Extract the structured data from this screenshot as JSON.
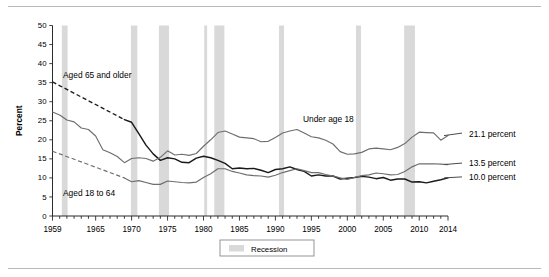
{
  "figure": {
    "frame_top_rule": true,
    "frame_bottom_rule": true
  },
  "legend": {
    "recession_label": "Recession",
    "recession_color": "#d9d9d9"
  },
  "annotations": {
    "aged65_label": "Aged 65 and older",
    "under18_label": "Under age 18",
    "aged18to64_label": "Aged 18 to 64",
    "end_under18": "21.1 percent",
    "end_aged18to64": "13.5 percent",
    "end_aged65": "10.0 percent"
  },
  "chart_data": {
    "type": "line",
    "title": "",
    "subtitle": "",
    "xlabel": "",
    "ylabel": "Percent",
    "xlim": [
      1959,
      2014
    ],
    "ylim": [
      0,
      50
    ],
    "ytick_labels": [
      "0",
      "5",
      "10",
      "15",
      "20",
      "25",
      "30",
      "35",
      "40",
      "45",
      "50"
    ],
    "yticks": [
      0,
      5,
      10,
      15,
      20,
      25,
      30,
      35,
      40,
      45,
      50
    ],
    "xtick_labels": [
      "1959",
      "1965",
      "1970",
      "1975",
      "1980",
      "1985",
      "1990",
      "1995",
      "2000",
      "2005",
      "2010",
      "2014"
    ],
    "xticks_labeled": [
      1959,
      1965,
      1970,
      1975,
      1980,
      1985,
      1990,
      1995,
      2000,
      2005,
      2010,
      2014
    ],
    "xtick_minor_interval": 1,
    "grid": false,
    "legend_position": "below-axis-center",
    "line_colors": {
      "aged_65_and_older": "#1a1a1a",
      "under_age_18": "#6e6e6e",
      "aged_18_to_64": "#6e6e6e"
    },
    "series": [
      {
        "name": "Aged 65 and older",
        "color": "#1a1a1a",
        "dashed_range": [
          1959,
          1969
        ],
        "x": [
          1959,
          1960,
          1961,
          1962,
          1963,
          1964,
          1965,
          1966,
          1967,
          1968,
          1969,
          1970,
          1971,
          1972,
          1973,
          1974,
          1975,
          1976,
          1977,
          1978,
          1979,
          1980,
          1981,
          1982,
          1983,
          1984,
          1985,
          1986,
          1987,
          1988,
          1989,
          1990,
          1991,
          1992,
          1993,
          1994,
          1995,
          1996,
          1997,
          1998,
          1999,
          2000,
          2001,
          2002,
          2003,
          2004,
          2005,
          2006,
          2007,
          2008,
          2009,
          2010,
          2011,
          2012,
          2013,
          2014
        ],
        "y": [
          35.2,
          33.1,
          32.0,
          31.0,
          30.0,
          29.0,
          28.2,
          27.3,
          29.5,
          25.0,
          25.3,
          24.6,
          21.6,
          18.6,
          16.3,
          14.6,
          15.3,
          15.0,
          14.1,
          14.0,
          15.2,
          15.7,
          15.3,
          14.6,
          13.8,
          12.4,
          12.6,
          12.4,
          12.5,
          12.0,
          11.4,
          12.2,
          12.4,
          12.9,
          12.2,
          11.7,
          10.5,
          10.8,
          10.5,
          10.5,
          9.7,
          9.9,
          10.1,
          10.4,
          10.2,
          9.8,
          10.1,
          9.4,
          9.7,
          9.7,
          8.9,
          9.0,
          8.7,
          9.1,
          9.5,
          10.0
        ]
      },
      {
        "name": "Under age 18",
        "color": "#6e6e6e",
        "dashed_range": null,
        "x": [
          1959,
          1960,
          1961,
          1962,
          1963,
          1964,
          1965,
          1966,
          1967,
          1968,
          1969,
          1970,
          1971,
          1972,
          1973,
          1974,
          1975,
          1976,
          1977,
          1978,
          1979,
          1980,
          1981,
          1982,
          1983,
          1984,
          1985,
          1986,
          1987,
          1988,
          1989,
          1990,
          1991,
          1992,
          1993,
          1994,
          1995,
          1996,
          1997,
          1998,
          1999,
          2000,
          2001,
          2002,
          2003,
          2004,
          2005,
          2006,
          2007,
          2008,
          2009,
          2010,
          2011,
          2012,
          2013,
          2014
        ],
        "y": [
          27.3,
          26.5,
          25.2,
          24.7,
          23.1,
          22.7,
          21.0,
          17.4,
          16.6,
          15.6,
          14.0,
          15.1,
          15.3,
          15.1,
          14.4,
          15.4,
          17.1,
          16.0,
          16.2,
          15.9,
          16.4,
          18.3,
          20.0,
          21.9,
          22.3,
          21.5,
          20.7,
          20.5,
          20.3,
          19.5,
          19.6,
          20.6,
          21.8,
          22.3,
          22.7,
          21.8,
          20.8,
          20.5,
          19.9,
          18.9,
          16.9,
          16.2,
          16.3,
          16.7,
          17.6,
          17.8,
          17.6,
          17.4,
          18.0,
          19.0,
          20.7,
          22.0,
          21.9,
          21.8,
          19.9,
          21.1
        ]
      },
      {
        "name": "Aged 18 to 64",
        "color": "#6e6e6e",
        "dashed_range": [
          1959,
          1969
        ],
        "x": [
          1959,
          1960,
          1961,
          1962,
          1963,
          1964,
          1965,
          1966,
          1967,
          1968,
          1969,
          1970,
          1971,
          1972,
          1973,
          1974,
          1975,
          1976,
          1977,
          1978,
          1979,
          1980,
          1981,
          1982,
          1983,
          1984,
          1985,
          1986,
          1987,
          1988,
          1989,
          1990,
          1991,
          1992,
          1993,
          1994,
          1995,
          1996,
          1997,
          1998,
          1999,
          2000,
          2001,
          2002,
          2003,
          2004,
          2005,
          2006,
          2007,
          2008,
          2009,
          2010,
          2011,
          2012,
          2013,
          2014
        ],
        "y": [
          17.0,
          16.2,
          15.5,
          14.9,
          14.2,
          13.6,
          12.9,
          12.3,
          11.5,
          10.8,
          10.0,
          9.0,
          9.3,
          8.8,
          8.3,
          8.3,
          9.2,
          9.0,
          8.8,
          8.7,
          8.9,
          10.1,
          11.1,
          12.4,
          12.4,
          11.7,
          11.3,
          10.8,
          10.6,
          10.5,
          10.2,
          10.7,
          11.4,
          11.9,
          12.4,
          11.9,
          11.4,
          11.4,
          10.9,
          10.5,
          10.0,
          9.6,
          10.1,
          10.6,
          10.8,
          11.3,
          11.1,
          10.8,
          10.9,
          11.7,
          12.9,
          13.7,
          13.7,
          13.7,
          13.6,
          13.5
        ]
      }
    ],
    "recession_bands": [
      {
        "start": 1960.3,
        "end": 1961.1
      },
      {
        "start": 1969.9,
        "end": 1970.8
      },
      {
        "start": 1973.8,
        "end": 1975.2
      },
      {
        "start": 1980.1,
        "end": 1980.5
      },
      {
        "start": 1981.5,
        "end": 1982.9
      },
      {
        "start": 1990.5,
        "end": 1991.2
      },
      {
        "start": 2001.2,
        "end": 2001.9
      },
      {
        "start": 2007.9,
        "end": 2009.4
      }
    ]
  }
}
